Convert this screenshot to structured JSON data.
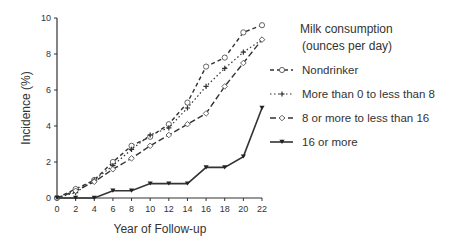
{
  "chart_data": {
    "type": "line",
    "title": "",
    "xlabel": "Year of Follow-up",
    "ylabel": "Incidence (%)",
    "xlim": [
      0,
      22
    ],
    "ylim": [
      0,
      10
    ],
    "x_ticks": [
      0,
      2,
      4,
      6,
      8,
      10,
      12,
      14,
      16,
      18,
      20,
      22
    ],
    "y_ticks": [
      0,
      2,
      4,
      6,
      8,
      10
    ],
    "grid": false,
    "legend_title": [
      "Milk consumption",
      "(ounces per day)"
    ],
    "legend_position": "right",
    "x": [
      0,
      2,
      4,
      6,
      8,
      10,
      12,
      14,
      16,
      18,
      20,
      22
    ],
    "series": [
      {
        "name": "Nondrinker",
        "style": "short-dash",
        "marker": "circle",
        "values": [
          0,
          0.5,
          1.0,
          2.0,
          2.9,
          3.4,
          4.1,
          5.3,
          7.3,
          7.8,
          9.2,
          9.6
        ]
      },
      {
        "name": "More than 0 to less than 8",
        "style": "dotted",
        "marker": "plus",
        "values": [
          0,
          0.3,
          1.0,
          1.8,
          2.7,
          3.5,
          3.9,
          5.0,
          6.2,
          7.2,
          8.1,
          8.8
        ]
      },
      {
        "name": "8 or more to less than 16",
        "style": "long-dash",
        "marker": "diamond",
        "values": [
          0,
          0.4,
          0.9,
          1.6,
          2.2,
          2.9,
          3.5,
          4.1,
          4.7,
          6.2,
          7.5,
          8.8
        ]
      },
      {
        "name": "16 or more",
        "style": "solid",
        "marker": "triangle",
        "values": [
          0,
          0,
          0,
          0.4,
          0.4,
          0.8,
          0.8,
          0.8,
          1.7,
          1.7,
          2.3,
          5.0
        ]
      }
    ]
  }
}
